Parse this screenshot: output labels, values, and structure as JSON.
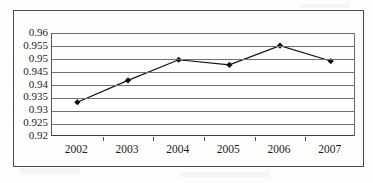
{
  "chart_data": {
    "type": "line",
    "title": "",
    "xlabel": "",
    "ylabel": "",
    "categories": [
      "2002",
      "2003",
      "2004",
      "2005",
      "2006",
      "2007"
    ],
    "values": [
      0.9335,
      0.942,
      0.95,
      0.948,
      0.9555,
      0.9495
    ],
    "series": [
      {
        "name": "series-1",
        "values": [
          0.9335,
          0.942,
          0.95,
          0.948,
          0.9555,
          0.9495
        ]
      }
    ],
    "ylim": [
      0.92,
      0.96
    ],
    "ytick_labels": [
      "0.96",
      "0.955",
      "0.95",
      "0.945",
      "0.94",
      "0.935",
      "0.93",
      "0.925",
      "0.92"
    ],
    "ytick_values": [
      0.96,
      0.955,
      0.95,
      0.945,
      0.94,
      0.935,
      0.93,
      0.925,
      0.92
    ],
    "grid": true,
    "legend": false,
    "legend_position": "none",
    "marker": "diamond",
    "line_color": "#111111",
    "marker_color": "#0d0d0d",
    "gridline_color": "#6f6f6f",
    "plot_background": "#fefefe"
  }
}
